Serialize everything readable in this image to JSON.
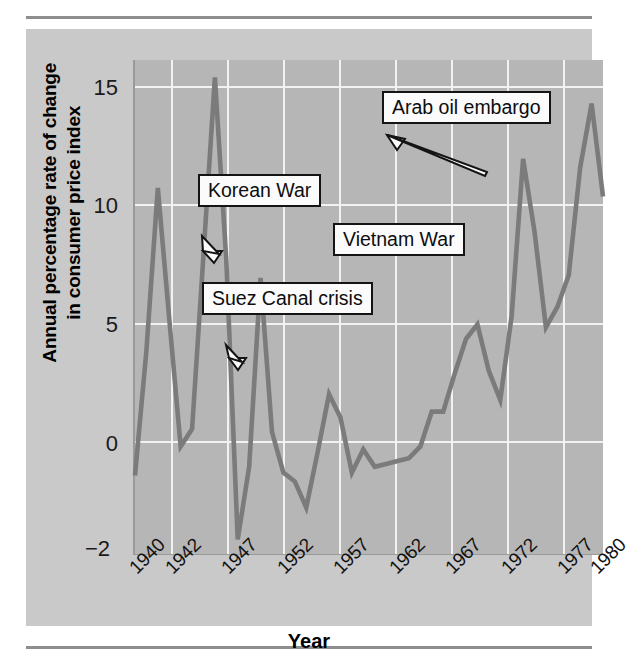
{
  "figure": {
    "background_color": "#c9c9c9",
    "plot_background_color": "#b6b6b6",
    "grid_color": "#f2f2f2",
    "line_color": "#7b7b7b"
  },
  "axes": {
    "y_title": "Annual percentage rate of change\nin consumer price index",
    "y_title_line1": "Annual percentage rate of change",
    "y_title_line2": "in consumer price index",
    "x_title": "Year",
    "y_ticks": [
      "15",
      "10",
      "5",
      "0",
      "−2"
    ],
    "x_ticks": [
      "1940",
      "1942",
      "1947",
      "1952",
      "1957",
      "1962",
      "1967",
      "1972",
      "1977",
      "1980"
    ]
  },
  "annotations": [
    {
      "label": "Arab oil embargo"
    },
    {
      "label": "Korean War"
    },
    {
      "label": "Vietnam War"
    },
    {
      "label": "Suez Canal crisis"
    }
  ],
  "chart_data": {
    "type": "line",
    "title": "",
    "subtitle": "",
    "xlabel": "Year",
    "ylabel": "Annual percentage rate of change in consumer price index",
    "xlim": [
      1940,
      1981
    ],
    "ylim": [
      -2,
      15
    ],
    "grid": true,
    "legend": "none",
    "x_tick_labels": [
      "1940",
      "1942",
      "1947",
      "1952",
      "1957",
      "1962",
      "1967",
      "1972",
      "1977",
      "1980"
    ],
    "y_tick_labels": [
      "15",
      "10",
      "5",
      "0",
      "-2"
    ],
    "series": [
      {
        "name": "Annual percentage rate of change in consumer price index",
        "color": "#7b7b7b",
        "x": [
          1940,
          1941,
          1942,
          1943,
          1944,
          1945,
          1946,
          1947,
          1948,
          1949,
          1950,
          1951,
          1952,
          1953,
          1954,
          1955,
          1956,
          1957,
          1958,
          1959,
          1960,
          1961,
          1962,
          1963,
          1964,
          1965,
          1966,
          1967,
          1968,
          1969,
          1970,
          1971,
          1972,
          1973,
          1974,
          1975,
          1976,
          1977,
          1978,
          1979,
          1980,
          1981
        ],
        "y": [
          0.7,
          5.0,
          10.6,
          6.1,
          1.7,
          2.3,
          8.3,
          14.4,
          8.1,
          -1.5,
          1.0,
          7.5,
          2.2,
          0.8,
          0.5,
          -0.4,
          1.5,
          3.5,
          2.7,
          0.8,
          1.6,
          1.0,
          1.1,
          1.2,
          1.3,
          1.7,
          2.9,
          2.9,
          4.2,
          5.4,
          5.9,
          4.3,
          3.3,
          6.2,
          11.6,
          9.1,
          5.8,
          6.5,
          7.6,
          11.3,
          13.5,
          10.3
        ]
      }
    ],
    "annotations": [
      {
        "text": "Korean War",
        "points_to_x": 1951,
        "points_to_y": 7.5
      },
      {
        "text": "Suez Canal crisis",
        "points_to_x": 1957,
        "points_to_y": 3.5
      },
      {
        "text": "Vietnam War",
        "points_to_x": 1969,
        "points_to_y": 5.4
      },
      {
        "text": "Arab oil embargo",
        "points_to_x": 1974,
        "points_to_y": 11.6
      }
    ]
  }
}
